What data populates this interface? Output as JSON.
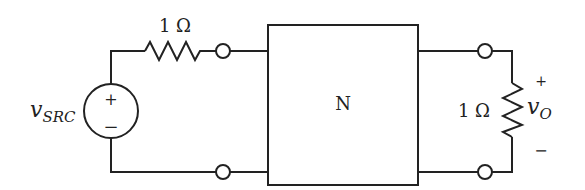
{
  "diagram": {
    "type": "circuit",
    "source": {
      "label_main": "v",
      "label_sub": "SRC",
      "plus": "+",
      "minus": "−"
    },
    "series_resistor": {
      "label": "1 Ω"
    },
    "network": {
      "label": "N"
    },
    "load_resistor": {
      "label": "1 Ω"
    },
    "output": {
      "label_main": "v",
      "label_sub": "O",
      "plus": "+",
      "minus": "−"
    },
    "stroke_color": "#222222"
  }
}
